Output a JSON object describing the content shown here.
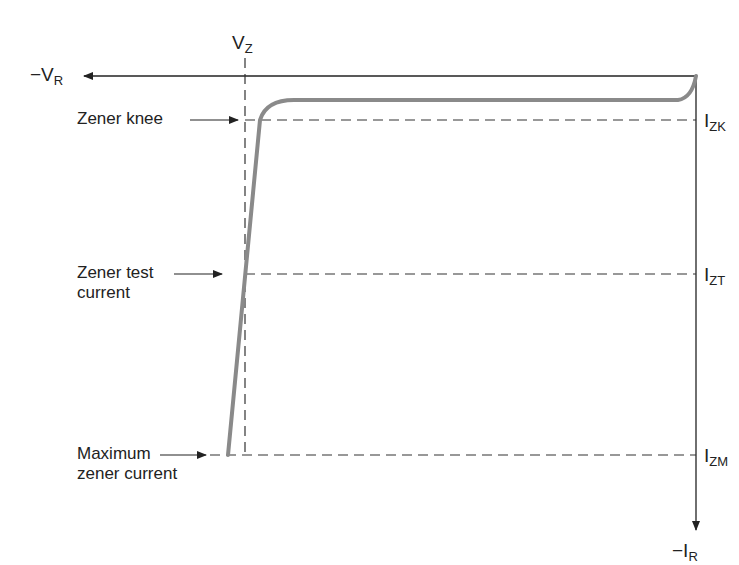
{
  "diagram": {
    "axes": {
      "x_label_prefix": "−V",
      "x_label_sub": "R",
      "y_label_prefix": "−I",
      "y_label_sub": "R"
    },
    "vz": {
      "prefix": "V",
      "sub": "Z"
    },
    "levels": [
      {
        "id": "izk",
        "prefix": "I",
        "sub": "ZK",
        "annotation": "Zener knee"
      },
      {
        "id": "izt",
        "prefix": "I",
        "sub": "ZT",
        "annotation_line1": "Zener test",
        "annotation_line2": "current"
      },
      {
        "id": "izm",
        "prefix": "I",
        "sub": "ZM",
        "annotation_line1": "Maximum",
        "annotation_line2": "zener current"
      }
    ],
    "colors": {
      "curve": "#8a8a8a",
      "axis": "#222222",
      "dash": "#333333"
    }
  }
}
